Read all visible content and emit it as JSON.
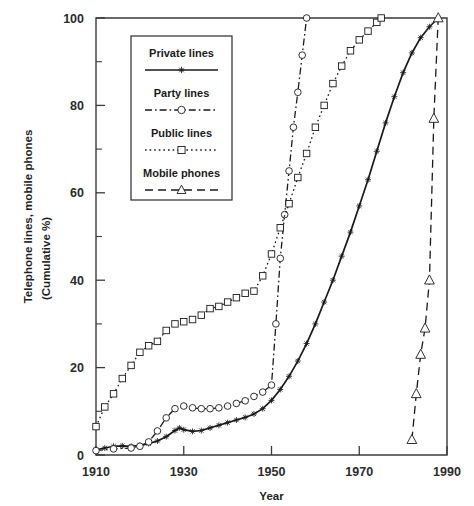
{
  "chart_data": {
    "type": "line",
    "title": "",
    "xlabel": "Year",
    "ylabel": "Telephone lines, mobile phones",
    "ylabel_line2": "(Cumulative %)",
    "xlim": [
      1910,
      1990
    ],
    "ylim": [
      0,
      100
    ],
    "xticks": [
      1910,
      1930,
      1950,
      1970,
      1990
    ],
    "xtick_labels": [
      "1910",
      "1930",
      "1950",
      "1970",
      "1990"
    ],
    "yticks": [
      0,
      20,
      40,
      60,
      80,
      100
    ],
    "ytick_labels": [
      "0",
      "20",
      "40",
      "60",
      "80",
      "100"
    ],
    "yticks_minor": [
      10,
      30,
      50,
      70,
      90
    ],
    "grid": false,
    "legend_position": "upper-left-inside",
    "series": [
      {
        "name": "Private lines",
        "line_style": "solid",
        "marker": "star",
        "color": "#1a1a1a",
        "x": [
          1910,
          1912,
          1914,
          1916,
          1918,
          1920,
          1922,
          1924,
          1926,
          1928,
          1929,
          1930,
          1932,
          1934,
          1936,
          1938,
          1940,
          1942,
          1944,
          1946,
          1948,
          1950,
          1952,
          1954,
          1956,
          1958,
          1960,
          1962,
          1964,
          1966,
          1968,
          1970,
          1972,
          1974,
          1976,
          1978,
          1980,
          1982,
          1984,
          1986,
          1988
        ],
        "y": [
          1.2,
          1.6,
          2.0,
          2.1,
          2.0,
          2.2,
          2.6,
          3.2,
          4.2,
          5.6,
          6.2,
          5.8,
          5.4,
          5.6,
          6.2,
          6.8,
          7.4,
          8.0,
          8.6,
          9.4,
          10.6,
          12.5,
          15.0,
          18.0,
          21.5,
          25.5,
          30.0,
          35.0,
          40.0,
          45.5,
          51.0,
          57.0,
          63.0,
          69.5,
          76.0,
          82.0,
          87.5,
          92.0,
          95.5,
          98.0,
          100.0
        ]
      },
      {
        "name": "Party lines",
        "line_style": "dash-dot",
        "marker": "circle",
        "color": "#1a1a1a",
        "x": [
          1910,
          1914,
          1918,
          1920,
          1922,
          1924,
          1926,
          1928,
          1930,
          1932,
          1934,
          1936,
          1938,
          1940,
          1942,
          1944,
          1946,
          1948,
          1950,
          1951,
          1952,
          1953,
          1954,
          1955,
          1956,
          1957,
          1958
        ],
        "y": [
          1.0,
          1.4,
          1.6,
          2.0,
          3.0,
          5.5,
          8.5,
          10.6,
          11.2,
          10.8,
          10.6,
          10.6,
          10.8,
          11.2,
          11.8,
          12.4,
          13.4,
          14.4,
          16.0,
          30.0,
          45.0,
          55.0,
          65.0,
          75.0,
          83.0,
          91.5,
          100.0
        ]
      },
      {
        "name": "Public lines",
        "line_style": "dotted",
        "marker": "square",
        "color": "#1a1a1a",
        "x": [
          1910,
          1912,
          1914,
          1916,
          1918,
          1920,
          1922,
          1924,
          1926,
          1928,
          1930,
          1932,
          1934,
          1936,
          1938,
          1940,
          1942,
          1944,
          1946,
          1948,
          1950,
          1952,
          1954,
          1956,
          1958,
          1960,
          1962,
          1964,
          1966,
          1968,
          1970,
          1972,
          1974,
          1975
        ],
        "y": [
          6.5,
          11.0,
          14.0,
          17.5,
          20.5,
          23.5,
          25.0,
          26.0,
          28.5,
          30.0,
          30.5,
          31.0,
          32.0,
          33.5,
          34.0,
          35.0,
          36.0,
          37.0,
          37.5,
          41.0,
          46.0,
          52.0,
          57.5,
          63.5,
          69.0,
          75.0,
          80.0,
          85.0,
          89.0,
          92.5,
          95.0,
          97.0,
          99.0,
          100.0
        ]
      },
      {
        "name": "Mobile phones",
        "line_style": "dashed",
        "marker": "triangle",
        "color": "#1a1a1a",
        "x": [
          1982,
          1983,
          1984,
          1985,
          1986,
          1987,
          1988
        ],
        "y": [
          3.5,
          14.0,
          23.0,
          29.0,
          40.0,
          77.0,
          100.0
        ]
      }
    ]
  },
  "legend": {
    "entries": [
      {
        "label": "Private lines",
        "style": "solid",
        "marker": "star"
      },
      {
        "label": "Party lines",
        "style": "dash-dot",
        "marker": "circle"
      },
      {
        "label": "Public lines",
        "style": "dotted",
        "marker": "square"
      },
      {
        "label": "Mobile phones",
        "style": "dashed",
        "marker": "triangle"
      }
    ]
  }
}
